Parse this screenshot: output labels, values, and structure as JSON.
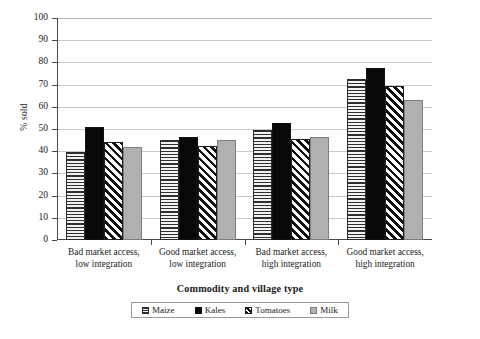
{
  "chart_data": {
    "type": "bar",
    "title": "",
    "xlabel": "Commodity and village type",
    "ylabel": "% sold",
    "ylim": [
      0,
      100
    ],
    "ytick_step": 10,
    "yticks": [
      100,
      90,
      80,
      70,
      60,
      50,
      40,
      30,
      20,
      10,
      0
    ],
    "grid": "horizontal",
    "legend_position": "bottom",
    "categories": [
      "Bad market access, low integration",
      "Good market access, low integration",
      "Bad market access, high integration",
      "Good market access, high integration"
    ],
    "category_lines": [
      {
        "line1": "Bad market access,",
        "line2": "low integration"
      },
      {
        "line1": "Good market access,",
        "line2": "low integration"
      },
      {
        "line1": "Bad market access,",
        "line2": "high integration"
      },
      {
        "line1": "Good market access,",
        "line2": "high integration"
      }
    ],
    "series": [
      {
        "name": "Maize",
        "pattern": "horizontal-lines",
        "values": [
          39.5,
          45.0,
          49.5,
          72.5
        ]
      },
      {
        "name": "Kales",
        "pattern": "solid-black",
        "values": [
          51.0,
          46.5,
          52.5,
          77.5
        ]
      },
      {
        "name": "Tomatoes",
        "pattern": "diagonal-hatch",
        "values": [
          44.0,
          42.5,
          45.5,
          69.5
        ]
      },
      {
        "name": "Milk",
        "pattern": "solid-gray",
        "values": [
          42.0,
          45.0,
          46.5,
          63.0
        ]
      }
    ]
  },
  "colors": {
    "axis": "#4a4a4a",
    "gridline": "#c9c9c9",
    "kales": "#080808",
    "milk": "#b0b0b0",
    "background": "#ffffff"
  }
}
